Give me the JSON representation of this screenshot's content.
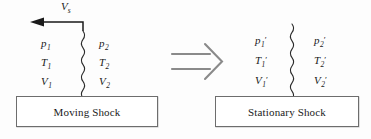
{
  "figure": {
    "type": "physics-diagram",
    "background_color": "#fdfdfd",
    "ink_color": "#1a1a1a"
  },
  "left_panel": {
    "caption": "Moving Shock",
    "velocity_arrow": {
      "label_symbol": "V",
      "label_subscript": "s",
      "direction": "left",
      "icon": "leftward-arrow-icon"
    },
    "shock_line": {
      "icon": "wavy-shock-line-icon",
      "style": "wavy vertical"
    },
    "upstream_states": [
      {
        "symbol": "p",
        "subscript": "1",
        "prime": ""
      },
      {
        "symbol": "T",
        "subscript": "1",
        "prime": ""
      },
      {
        "symbol": "V",
        "subscript": "1",
        "prime": ""
      }
    ],
    "downstream_states": [
      {
        "symbol": "p",
        "subscript": "2",
        "prime": ""
      },
      {
        "symbol": "T",
        "subscript": "2",
        "prime": ""
      },
      {
        "symbol": "V",
        "subscript": "2",
        "prime": ""
      }
    ]
  },
  "transform_arrow": {
    "glyph": "implies-double-arrow-icon",
    "direction": "right"
  },
  "right_panel": {
    "caption": "Stationary Shock",
    "shock_line": {
      "icon": "wavy-shock-line-icon",
      "style": "wavy vertical"
    },
    "upstream_states": [
      {
        "symbol": "p",
        "subscript": "1",
        "prime": "′"
      },
      {
        "symbol": "T",
        "subscript": "1",
        "prime": "′"
      },
      {
        "symbol": "V",
        "subscript": "1",
        "prime": "′"
      }
    ],
    "downstream_states": [
      {
        "symbol": "p",
        "subscript": "2",
        "prime": "′"
      },
      {
        "symbol": "T",
        "subscript": "2",
        "prime": "′"
      },
      {
        "symbol": "V",
        "subscript": "2",
        "prime": "′"
      }
    ]
  }
}
